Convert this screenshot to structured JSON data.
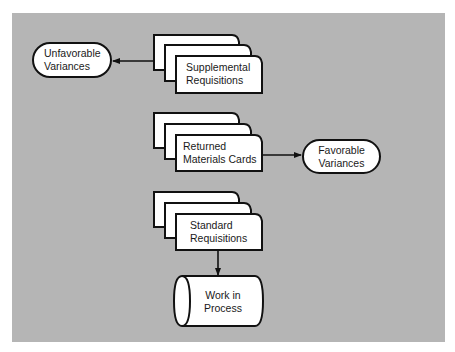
{
  "diagram": {
    "type": "document-flowchart",
    "colors": {
      "background": "#b5b5b5",
      "shape_fill": "#ffffff",
      "stroke": "#111111"
    },
    "nodes": [
      {
        "id": "supplemental",
        "kind": "multi-document",
        "line1": "Supplemental",
        "line2": "Requisitions"
      },
      {
        "id": "unfavorable",
        "kind": "terminal",
        "line1": "Unfavorable",
        "line2": "Variances"
      },
      {
        "id": "returned",
        "kind": "multi-document",
        "line1": "Returned",
        "line2": "Materials Cards"
      },
      {
        "id": "favorable",
        "kind": "terminal",
        "line1": "Favorable",
        "line2": "Variances"
      },
      {
        "id": "standard",
        "kind": "multi-document",
        "line1": "Standard",
        "line2": "Requisitions"
      },
      {
        "id": "wip",
        "kind": "storage",
        "line1": "Work in",
        "line2": "Process"
      }
    ],
    "edges": [
      {
        "from": "supplemental",
        "to": "unfavorable"
      },
      {
        "from": "returned",
        "to": "favorable"
      },
      {
        "from": "standard",
        "to": "wip"
      }
    ]
  }
}
